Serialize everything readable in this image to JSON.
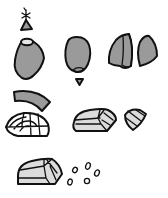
{
  "figure": {
    "colors": {
      "outline": "#111111",
      "fill_gray": "#9a9a9a",
      "fill_light": "#dcdcdc",
      "background": "#ffffff"
    },
    "items": [
      {
        "name": "star-sprout"
      },
      {
        "name": "small-wedge"
      },
      {
        "name": "large-pebble"
      },
      {
        "name": "oval-pebble"
      },
      {
        "name": "tiny-triangle"
      },
      {
        "name": "split-shard-left"
      },
      {
        "name": "split-shard-right"
      },
      {
        "name": "arc-segment"
      },
      {
        "name": "faceted-dome"
      },
      {
        "name": "faceted-block"
      },
      {
        "name": "small-faceted-piece"
      },
      {
        "name": "bottom-faceted-block"
      },
      {
        "name": "granules"
      }
    ]
  }
}
